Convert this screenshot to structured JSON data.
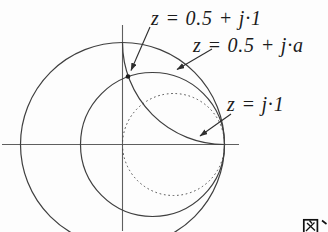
{
  "figure": {
    "background_color": "#fdfdfd",
    "curve_color": "#3f3f3f",
    "axis_color": "#5f5f5f",
    "text_color": "#1b1b1b",
    "labels": {
      "point_r05_x1": "z = 0.5 + j·1",
      "locus_r05_xa": "z = 0.5 + j·a",
      "arc_x1": "z = j·1"
    },
    "caption_fragment": "図"
  }
}
